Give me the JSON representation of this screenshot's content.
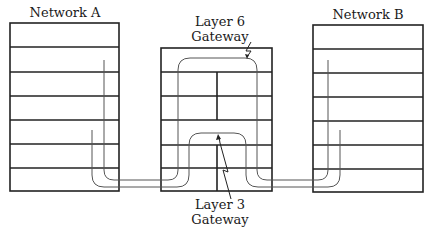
{
  "labels": {
    "network_a": "Network A",
    "network_b": "Network B",
    "layer6_line1": "Layer 6",
    "layer6_line2": "Gateway",
    "layer3_line1": "Layer 3",
    "layer3_line2": "Gateway"
  },
  "stacks": {
    "network_a": {
      "layers": 7
    },
    "gateway": {
      "layers": 7
    },
    "network_b": {
      "layers": 7
    }
  },
  "colors": {
    "stack_stroke": "#222222",
    "path_stroke": "#555555",
    "background": "#ffffff"
  }
}
